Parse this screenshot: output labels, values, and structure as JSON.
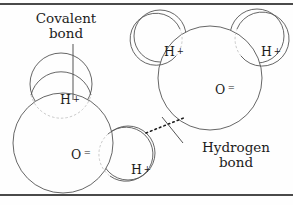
{
  "figure": {
    "title_text_blocks": {
      "covalent": "Covalent\nbond",
      "hydrogen": "Hydrogen\nbond"
    },
    "colors": {
      "rule": "#4a4a4a",
      "outline": "#555555",
      "leader": "#555555",
      "bond_dotted": "#1c1c1c",
      "text": "#1c1c1c",
      "background": "#fefefe"
    },
    "molecule_left": {
      "name": "water-molecule-left",
      "oxygen": {
        "label_atom": "O",
        "label_charge": "=",
        "cx": 63,
        "cy": 143,
        "r": 50
      },
      "hydrogens": [
        {
          "label_atom": "H",
          "label_charge": "+",
          "cx": 61,
          "cy": 84,
          "r": 31
        },
        {
          "label_atom": "H",
          "label_charge": "+",
          "cx": 128,
          "cy": 153,
          "r": 27
        }
      ]
    },
    "molecule_right": {
      "name": "water-molecule-right",
      "oxygen": {
        "label_atom": "O",
        "label_charge": "=",
        "cx": 210,
        "cy": 78,
        "r": 52
      },
      "hydrogens": [
        {
          "label_atom": "H",
          "label_charge": "+",
          "cx": 160,
          "cy": 36,
          "r": 26
        },
        {
          "label_atom": "H",
          "label_charge": "+",
          "cx": 257,
          "cy": 36,
          "r": 27
        }
      ]
    },
    "bonds": {
      "hydrogen_bond": {
        "style": "dotted",
        "x1": 146,
        "y1": 133,
        "x2": 186,
        "y2": 117
      },
      "covalent_leader": {
        "style": "solid",
        "x1": 73,
        "y1": 44,
        "x2": 73,
        "y2": 100
      },
      "hydrogen_leader": {
        "style": "solid",
        "x1": 183,
        "y1": 143,
        "x2": 162,
        "y2": 117
      }
    }
  }
}
